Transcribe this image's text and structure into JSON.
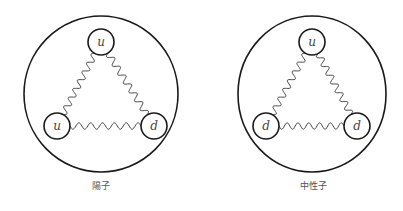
{
  "diagrams": [
    {
      "name": "proton",
      "caption": "陽子",
      "quarks": {
        "top": "u",
        "left": "u",
        "right": "d"
      }
    },
    {
      "name": "neutron",
      "caption": "中性子",
      "quarks": {
        "top": "u",
        "left": "d",
        "right": "d"
      }
    }
  ],
  "colors": {
    "stroke": "#1a1a1a",
    "gluon": "#333333",
    "label": "#444444",
    "background": "#ffffff"
  }
}
